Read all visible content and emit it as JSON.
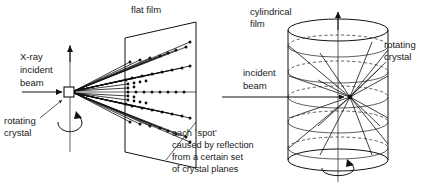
{
  "figure": {
    "background_color": "#ffffff",
    "ink_color": "#1a1a1a"
  },
  "left_panel": {
    "name": "flat-film-geometry",
    "labels": {
      "film": "flat film",
      "beam_line1": "X-ray",
      "beam_line2": "incident",
      "beam_line3": "beam",
      "crystal_line1": "rotating",
      "crystal_line2": "crystal"
    },
    "caption": {
      "line1": "each `spot'",
      "line2": "caused by reflection",
      "line3": "from a certain set",
      "line4": "of crystal planes"
    },
    "crystal": {
      "x": 70,
      "y": 92,
      "size": 9
    },
    "film": {
      "shape": "parallelogram",
      "front_top_x": 125,
      "front_top_y": 38,
      "back_top_x": 196,
      "back_top_y": 22
    }
  },
  "right_panel": {
    "name": "cylindrical-film-geometry",
    "labels": {
      "film_line1": "cylindrical",
      "film_line2": "film",
      "beam_line1": "incident",
      "beam_line2": "beam",
      "crystal_line1": "rotating",
      "crystal_line2": "crystal"
    },
    "cylinder": {
      "center_x": 338,
      "left_x": 288,
      "right_x": 388,
      "top_y": 30,
      "bottom_y": 160,
      "radius_x": 50,
      "radius_y": 11,
      "crystal_y": 97
    },
    "layer_lines": [
      46,
      72,
      97,
      122,
      148
    ]
  }
}
